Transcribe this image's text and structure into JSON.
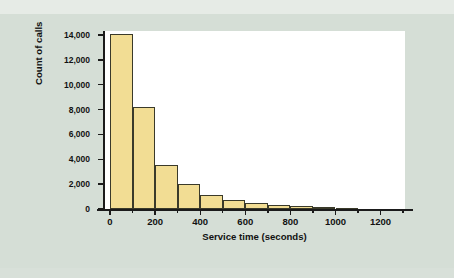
{
  "figure": {
    "background_color": "#d5ded6",
    "panel_color": "#ffffff",
    "bar_fill_color": "#f2dd94",
    "bar_edge_color": "#3a3a2a",
    "axis_color": "#1b1b1b"
  },
  "chart_data": {
    "type": "bar",
    "title": "",
    "subtitle": "",
    "xlabel": "Service time (seconds)",
    "ylabel": "Count of calls",
    "xlim": [
      -60,
      1340
    ],
    "ylim": [
      0,
      14600
    ],
    "grid": false,
    "legend": null,
    "bin_width": 100,
    "categories": [
      "0-100",
      "100-200",
      "200-300",
      "300-400",
      "400-500",
      "500-600",
      "600-700",
      "700-800",
      "800-900",
      "900-1000",
      "1000-1100",
      "1100-1200"
    ],
    "bin_starts": [
      0,
      100,
      200,
      300,
      400,
      500,
      600,
      700,
      800,
      900,
      1000,
      1100
    ],
    "values": [
      14100,
      8200,
      3550,
      2000,
      1150,
      700,
      520,
      300,
      250,
      200,
      60,
      0
    ],
    "xticks": [
      0,
      200,
      400,
      600,
      800,
      1000,
      1200
    ],
    "xtick_labels": [
      "0",
      "200",
      "400",
      "600",
      "800",
      "1000",
      "1200"
    ],
    "xticks_minor": [
      100,
      300,
      500,
      700,
      900,
      1100,
      1300
    ],
    "yticks": [
      0,
      2000,
      4000,
      6000,
      8000,
      10000,
      12000,
      14000
    ],
    "ytick_labels": [
      "0",
      "2,000",
      "4,000",
      "6,000",
      "8,000",
      "10,000",
      "12,000",
      "14,000"
    ]
  }
}
